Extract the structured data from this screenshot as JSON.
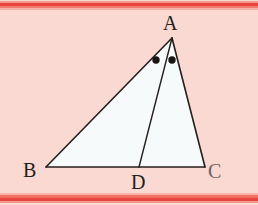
{
  "figure": {
    "kind": "euclidean-geometry-diagram",
    "width": 258,
    "height": 205
  },
  "colors": {
    "page_background": "#f9d9d1",
    "triangle_fill": "#f7fafa",
    "stroke": "#241e1c",
    "rule_red_dark": "#e8453c",
    "rule_red_mid": "#ef6f62",
    "rule_red_light": "#f4978c",
    "rule_red_pale": "#f6b2a7",
    "label_color": "#241e1c",
    "label_color_faded": "#6e6260",
    "angle_mark_color": "#1a1513"
  },
  "points": {
    "A": {
      "label": "A",
      "x": 172,
      "y": 38
    },
    "B": {
      "label": "B",
      "x": 46,
      "y": 167
    },
    "C": {
      "label": "C",
      "x": 205,
      "y": 167
    },
    "D": {
      "label": "D",
      "x": 139,
      "y": 167
    }
  },
  "segments": [
    {
      "name": "side-AB",
      "from": "A",
      "to": "B",
      "stroke_width": 1.6
    },
    {
      "name": "side-BC",
      "from": "B",
      "to": "C",
      "stroke_width": 1.6
    },
    {
      "name": "side-CA",
      "from": "C",
      "to": "A",
      "stroke_width": 1.6
    },
    {
      "name": "cevian-AD",
      "from": "A",
      "to": "D",
      "stroke_width": 1.4
    }
  ],
  "angle_marks": [
    {
      "name": "angle-mark-BAD",
      "x": 156,
      "y": 60,
      "radius": 3.7
    },
    {
      "name": "angle-mark-DAC",
      "x": 172,
      "y": 60,
      "radius": 3.7
    }
  ],
  "labels": {
    "a": "A",
    "b": "B",
    "c": "C",
    "d": "D"
  },
  "rules": {
    "top": [
      "#f4978c",
      "#e8453c",
      "#f07a6e",
      "#f6b2a7"
    ],
    "bottom": [
      "#f6b2a7",
      "#ef6f62",
      "#e8453c",
      "#f4978c"
    ]
  }
}
